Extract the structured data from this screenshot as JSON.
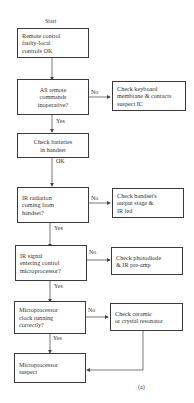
{
  "flowchart": {
    "start_label": "Start",
    "nodes": [
      {
        "id": "n1",
        "text": "Remote control\nfaulty-local\ncontrols OK"
      },
      {
        "id": "d1",
        "text": "All remote\ncommands\ninoperative?"
      },
      {
        "id": "a1",
        "text": "Check keyboard\nmembrane & contacts\nsuspect IC"
      },
      {
        "id": "n2",
        "text": "Check batteries\nin handset"
      },
      {
        "id": "d2",
        "text": "IR radiation\ncoming from\nhandset?"
      },
      {
        "id": "a2",
        "text": "Check handset's\noutput stage &\nIR led"
      },
      {
        "id": "d3",
        "text": "IR signal\nentering control\nmicroprocessor?"
      },
      {
        "id": "a3",
        "text": "Check photodiode\n& IR pre-amp"
      },
      {
        "id": "d4",
        "text": "Microprocessor\nclock running\ncorrectly?"
      },
      {
        "id": "a4",
        "text": "Check ceramic\nor crystal resonator"
      },
      {
        "id": "n3",
        "text": "Microprocessor\nsuspect"
      }
    ],
    "edge_labels": {
      "d1_no": "No",
      "d1_yes": "Yes",
      "n2_ok": "OK",
      "d2_no": "No",
      "d2_yes": "Yes",
      "d3_no": "No",
      "d3_yes": "Yes",
      "d4_no": "No",
      "d4_yes": "Yes"
    },
    "caption": "(a)"
  }
}
